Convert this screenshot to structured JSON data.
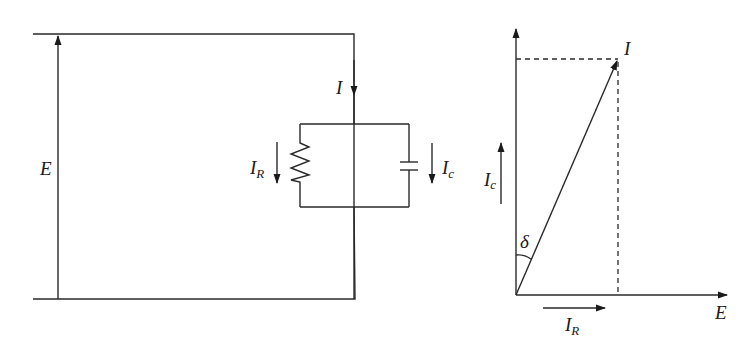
{
  "circuit": {
    "title": "Parallel RC circuit",
    "source_label": "E",
    "total_current_label": "I",
    "resistor_current": {
      "main": "I",
      "sub": "R"
    },
    "capacitor_current": {
      "main": "I",
      "sub": "c"
    }
  },
  "phasor": {
    "title": "Phasor diagram",
    "current_label": "I",
    "voltage_axis_label": "E",
    "capacitive_current": {
      "main": "I",
      "sub": "c"
    },
    "resistive_current": {
      "main": "I",
      "sub": "R"
    },
    "loss_angle_label": "δ"
  },
  "colors": {
    "line": "#2a2a2a",
    "text": "#1a1a1a",
    "background": "#ffffff"
  }
}
